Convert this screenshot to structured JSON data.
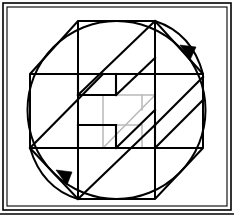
{
  "page": {
    "width": 234,
    "height": 221,
    "background_color": "#ffffff"
  },
  "colors": {
    "stroke": "#000000",
    "hidden_edge": "#b9b9b9",
    "frame": "#000000",
    "fill": "none"
  },
  "frame": {
    "name": "outer-border",
    "x": 3,
    "y": 3,
    "width": 228,
    "height": 207,
    "stroke_width": 1.6
  },
  "inner_frame": {
    "name": "inner-border",
    "x": 7,
    "y": 7,
    "width": 220,
    "height": 199,
    "stroke_width": 1.1
  },
  "baseline": {
    "name": "bottom-rule",
    "x1": 0,
    "y1": 214,
    "x2": 234,
    "y2": 214,
    "stroke_width": 1.6
  },
  "circle": {
    "name": "circumscribing-circle",
    "cx": 116.5,
    "cy": 110,
    "r": 89,
    "stroke_width": 2.0
  },
  "octagon": {
    "name": "inscribed-octagon",
    "stroke_width": 2.0,
    "points": [
      {
        "label": "top-left",
        "x": 78,
        "y": 21
      },
      {
        "label": "top-right",
        "x": 155,
        "y": 21
      },
      {
        "label": "right-top",
        "x": 203,
        "y": 74
      },
      {
        "label": "right-bottom",
        "x": 203,
        "y": 148
      },
      {
        "label": "bottom-right",
        "x": 155,
        "y": 199
      },
      {
        "label": "bottom-left",
        "x": 78,
        "y": 199
      },
      {
        "label": "left-bottom",
        "x": 30,
        "y": 148
      },
      {
        "label": "left-top",
        "x": 30,
        "y": 74
      }
    ]
  },
  "grid_lines": [
    {
      "name": "vertical-left",
      "x1": 78,
      "y1": 21,
      "x2": 78,
      "y2": 199
    },
    {
      "name": "vertical-right",
      "x1": 155,
      "y1": 21,
      "x2": 155,
      "y2": 199
    },
    {
      "name": "horizontal-upper",
      "x1": 30,
      "y1": 74,
      "x2": 203,
      "y2": 74
    },
    {
      "name": "horizontal-lower",
      "x1": 30,
      "y1": 148,
      "x2": 203,
      "y2": 148
    }
  ],
  "solid": {
    "name": "isometric-z-solid",
    "description": "Z-shaped stepped block drawn in isometric projection",
    "stroke_width": 2.0,
    "visible_edges": [
      {
        "name": "edge-top-long-diagonal",
        "x1": 78,
        "y1": 95,
        "x2": 155,
        "y2": 21
      },
      {
        "name": "edge-upper-face-left",
        "x1": 78,
        "y1": 95,
        "x2": 78,
        "y2": 74
      },
      {
        "name": "edge-upper-top-run",
        "x1": 78,
        "y1": 74,
        "x2": 116,
        "y2": 74
      },
      {
        "name": "edge-step-upper-vert",
        "x1": 116,
        "y1": 74,
        "x2": 116,
        "y2": 95
      },
      {
        "name": "edge-mid-upper-run",
        "x1": 78,
        "y1": 95,
        "x2": 116,
        "y2": 95
      },
      {
        "name": "edge-mid-diagonal-a",
        "x1": 116,
        "y1": 95,
        "x2": 155,
        "y2": 58
      },
      {
        "name": "edge-mid-left-diagonal",
        "x1": 30,
        "y1": 148,
        "x2": 103,
        "y2": 74
      },
      {
        "name": "edge-center-left-vert",
        "x1": 78,
        "y1": 125,
        "x2": 78,
        "y2": 148
      },
      {
        "name": "edge-center-run",
        "x1": 78,
        "y1": 125,
        "x2": 116,
        "y2": 125
      },
      {
        "name": "edge-center-vert2",
        "x1": 116,
        "y1": 125,
        "x2": 116,
        "y2": 148
      },
      {
        "name": "edge-center-run2",
        "x1": 116,
        "y1": 148,
        "x2": 155,
        "y2": 148
      },
      {
        "name": "edge-center-diagonal",
        "x1": 116,
        "y1": 148,
        "x2": 155,
        "y2": 110
      },
      {
        "name": "edge-lower-diagonal",
        "x1": 78,
        "y1": 199,
        "x2": 155,
        "y2": 125
      },
      {
        "name": "edge-right-diagonal",
        "x1": 155,
        "y1": 148,
        "x2": 203,
        "y2": 100
      },
      {
        "name": "edge-right-top-diag",
        "x1": 155,
        "y1": 74,
        "x2": 203,
        "y2": 74
      },
      {
        "name": "edge-right-vert",
        "x1": 155,
        "y1": 74,
        "x2": 155,
        "y2": 148
      },
      {
        "name": "edge-lower-left-run",
        "x1": 78,
        "y1": 148,
        "x2": 116,
        "y2": 148
      }
    ],
    "hidden_edges": [
      {
        "name": "hidden-diagonal-main",
        "x1": 103,
        "y1": 148,
        "x2": 155,
        "y2": 95
      },
      {
        "name": "hidden-vert-left",
        "x1": 103,
        "y1": 95,
        "x2": 103,
        "y2": 148
      },
      {
        "name": "hidden-run-top",
        "x1": 103,
        "y1": 95,
        "x2": 155,
        "y2": 95
      },
      {
        "name": "hidden-short-step",
        "x1": 142,
        "y1": 95,
        "x2": 142,
        "y2": 110
      }
    ]
  },
  "arrows": [
    {
      "name": "rotation-arrow-top-right",
      "description": "curved arrow sweeping clockwise near the upper-right arc",
      "path": "M 155 21 Q 192 33 203 74",
      "head": {
        "tip_x": 188,
        "tip_y": 55,
        "angle_deg": 52
      }
    },
    {
      "name": "rotation-arrow-bottom-left",
      "description": "curved arrow sweeping clockwise near the lower-left arc",
      "path": "M 30 148 Q 42 188 78 199",
      "head": {
        "tip_x": 64,
        "tip_y": 178,
        "angle_deg": 52
      }
    }
  ]
}
